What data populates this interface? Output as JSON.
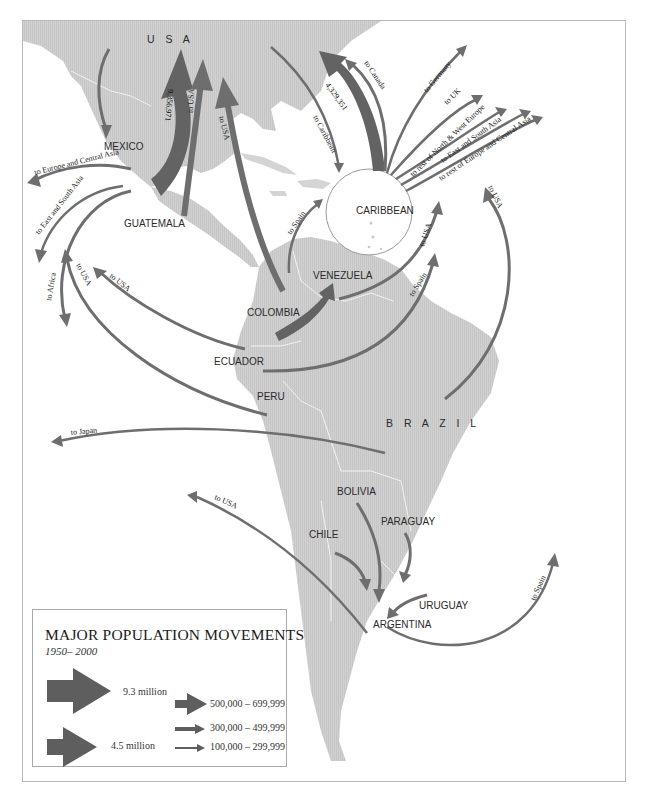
{
  "map": {
    "countries": {
      "usa": "U S A",
      "mexico": "MEXICO",
      "guatemala": "GUATEMALA",
      "caribbean": "CARIBBEAN",
      "venezuela": "VENEZUELA",
      "colombia": "COLOMBIA",
      "ecuador": "ECUADOR",
      "peru": "PERU",
      "brazil": "B R A Z I L",
      "bolivia": "BOLIVIA",
      "paraguay": "PARAGUAY",
      "chile": "CHILE",
      "uruguay": "URUGUAY",
      "argentina": "ARGENTINA"
    },
    "flows": {
      "mexico_usa_value": "9,356,971",
      "guatemala_usa": "to USA",
      "colombia_usa": "to USA",
      "mexico_europe": "to Europe and Central Asia",
      "mexico_asia": "to East and South Asia",
      "mexico_africa": "to Africa",
      "ecuador_usa": "to USA",
      "peru_usa": "to USA",
      "colombia_spain": "to Spain",
      "usa_caribbean": "to Caribbean",
      "caribbean_usa_value": "4,329,351",
      "caribbean_canada": "to Canada",
      "caribbean_germany": "to Germany",
      "caribbean_uk": "to UK",
      "caribbean_nw_europe": "to rest of North & West Europe",
      "caribbean_asia": "to East and South Asia",
      "caribbean_europe_central": "to rest of Europe and Central Asia",
      "venezuela_usa": "to USA",
      "ecuador_spain": "to Spain",
      "brazil_usa": "to USA",
      "brazil_japan": "to Japan",
      "chile_usa": "to USA",
      "argentina_spain": "to Spain"
    }
  },
  "legend": {
    "title": "MAJOR POPULATION MOVEMENTS",
    "subtitle": "1950– 2000",
    "items": [
      {
        "label": "9.3 million"
      },
      {
        "label": "4.5 million"
      },
      {
        "label": "500,000 – 699,999"
      },
      {
        "label": "300,000 – 499,999"
      },
      {
        "label": "100,000 – 299,999"
      }
    ]
  },
  "colors": {
    "land": "#c9c9c9",
    "arrow": "#6e6e6e",
    "frame": "#b8b8b8"
  }
}
